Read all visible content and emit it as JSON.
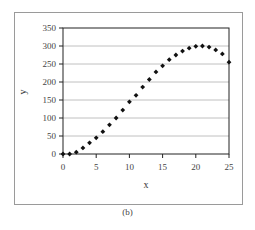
{
  "chart_data": {
    "type": "scatter",
    "title": "",
    "xlabel": "x",
    "ylabel": "y",
    "xlim": [
      0,
      25
    ],
    "ylim": [
      0,
      350
    ],
    "xticks": [
      0,
      5,
      10,
      15,
      20,
      25
    ],
    "yticks": [
      0,
      50,
      100,
      150,
      200,
      250,
      300,
      350
    ],
    "grid": {
      "horizontal": true,
      "vertical": false
    },
    "legend": null,
    "marker": "diamond",
    "marker_color": "#111111",
    "x": [
      0,
      1,
      2,
      3,
      4,
      5,
      6,
      7,
      8,
      9,
      10,
      11,
      12,
      13,
      14,
      15,
      16,
      17,
      18,
      19,
      20,
      21,
      22,
      23,
      24,
      25
    ],
    "y": [
      0,
      0,
      5,
      17,
      31,
      45,
      62,
      81,
      100,
      122,
      145,
      163,
      186,
      207,
      228,
      245,
      262,
      275,
      286,
      294,
      299,
      300,
      297,
      289,
      278,
      255
    ]
  },
  "caption": "(b)"
}
